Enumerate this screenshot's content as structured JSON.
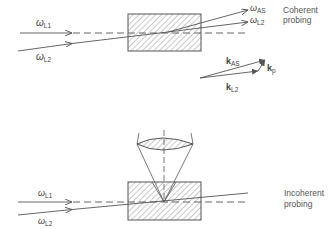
{
  "top_panel": {
    "caption_line1": "Coherent",
    "caption_line2": "probing",
    "input_beam_1": {
      "symbol": "ω",
      "sub": "L1"
    },
    "input_beam_2": {
      "symbol": "ω",
      "sub": "L2"
    },
    "output_beam_1": {
      "symbol": "ω",
      "sub": "AS"
    },
    "output_beam_2": {
      "symbol": "ω",
      "sub": "L2"
    },
    "vector_diagram": {
      "k_as": {
        "symbol": "k",
        "sub": "AS"
      },
      "k_l2": {
        "symbol": "k",
        "sub": "L2"
      },
      "k_p": {
        "symbol": "k",
        "sub": "p"
      }
    }
  },
  "bottom_panel": {
    "caption_line1": "Incoherent",
    "caption_line2": "probing",
    "input_beam_1": {
      "symbol": "ω",
      "sub": "L1"
    },
    "input_beam_2": {
      "symbol": "ω",
      "sub": "L2"
    }
  },
  "colors": {
    "line": "#555555",
    "hatch": "#777777",
    "text": "#444444"
  }
}
